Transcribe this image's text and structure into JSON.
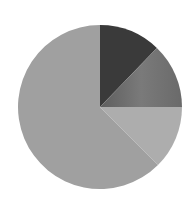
{
  "chart_data": {
    "type": "pie",
    "title": "",
    "legend": null,
    "start_angle_deg": 0,
    "direction": "clockwise",
    "center": [
      100,
      107
    ],
    "radius": 82,
    "slices": [
      {
        "label": "",
        "value": 12.2,
        "color": "#3a3a3a"
      },
      {
        "label": "",
        "value": 12.8,
        "color": "#6e6e6e"
      },
      {
        "label": "",
        "value": 12.5,
        "color": "#adadad"
      },
      {
        "label": "",
        "value": 62.5,
        "color": "#a0a0a0"
      }
    ],
    "values": [
      12.2,
      12.8,
      12.5,
      62.5
    ],
    "categories": [
      "",
      "",
      "",
      ""
    ]
  }
}
